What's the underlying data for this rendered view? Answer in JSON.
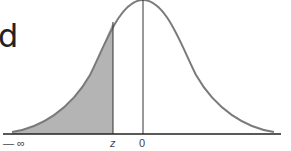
{
  "diagram": {
    "title_fragment": "d",
    "curve": "standard normal distribution",
    "shaded_region": "area from -infinity to z",
    "labels": {
      "neg_infinity": "— ∞",
      "z": "z",
      "zero": "0"
    },
    "colors": {
      "curve": "#7a7a7a",
      "shade": "#b4b4b4",
      "axis": "#222222"
    }
  }
}
